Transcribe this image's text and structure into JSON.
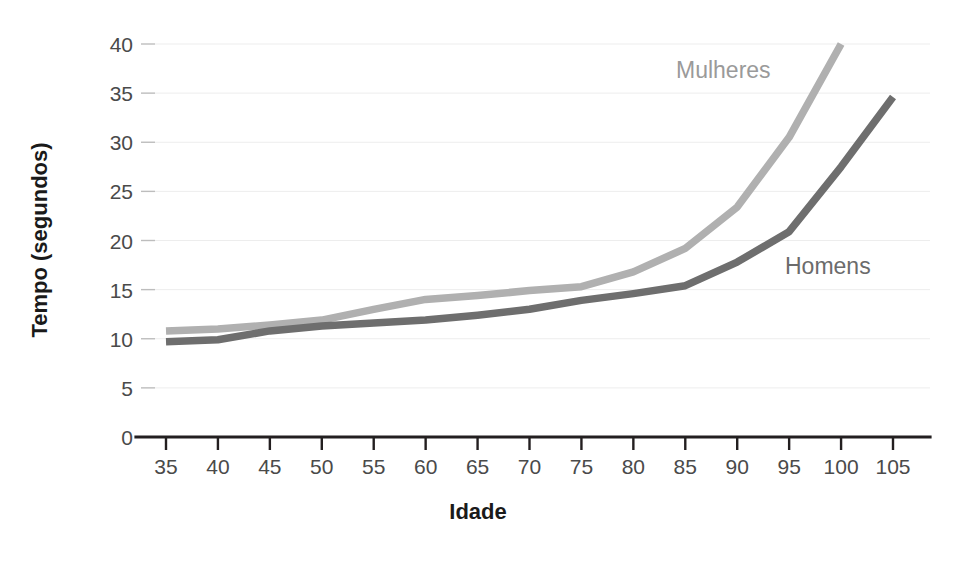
{
  "chart_data": {
    "type": "line",
    "title": "",
    "xlabel": "Idade",
    "ylabel": "Tempo (segundos)",
    "xlim": [
      35,
      105
    ],
    "ylim": [
      0,
      40
    ],
    "xticks": [
      35,
      40,
      45,
      50,
      55,
      60,
      65,
      70,
      75,
      80,
      85,
      90,
      95,
      100,
      105
    ],
    "yticks": [
      0,
      5,
      10,
      15,
      20,
      25,
      30,
      35,
      40
    ],
    "grid": "horizontal",
    "legend_position": "inline-annotations",
    "series": [
      {
        "name": "Mulheres",
        "color": "#b0b0b0",
        "label_x": 85,
        "label_y": 36.5,
        "x": [
          35,
          40,
          45,
          50,
          55,
          60,
          65,
          70,
          75,
          80,
          85,
          90,
          95,
          100
        ],
        "values": [
          10.8,
          11.0,
          11.4,
          11.9,
          13.0,
          14.0,
          14.4,
          14.9,
          15.3,
          16.8,
          19.2,
          23.4,
          30.5,
          40.0
        ]
      },
      {
        "name": "Homens",
        "color": "#6e6e6e",
        "label_x": 94,
        "label_y": 18.8,
        "x": [
          35,
          40,
          45,
          50,
          55,
          60,
          65,
          70,
          75,
          80,
          85,
          90,
          95,
          100,
          105
        ],
        "values": [
          9.7,
          9.9,
          10.8,
          11.3,
          11.6,
          11.9,
          12.4,
          13.0,
          13.9,
          14.6,
          15.4,
          17.8,
          20.9,
          27.5,
          34.6
        ]
      }
    ]
  },
  "axis": {
    "x_title": "Idade",
    "y_title": "Tempo (segundos)",
    "x_tick_labels": [
      "35",
      "40",
      "45",
      "50",
      "55",
      "60",
      "65",
      "70",
      "75",
      "80",
      "85",
      "90",
      "95",
      "100",
      "105"
    ],
    "y_tick_labels": [
      "0",
      "5",
      "10",
      "15",
      "20",
      "25",
      "30",
      "35",
      "40"
    ]
  },
  "annotations": {
    "women_label": "Mulheres",
    "men_label": "Homens"
  },
  "colors": {
    "women": "#b0b0b0",
    "men": "#6e6e6e",
    "axis": "#231f20",
    "grid": "#ededed",
    "tick_text": "#4a4a4a",
    "background": "#ffffff"
  }
}
